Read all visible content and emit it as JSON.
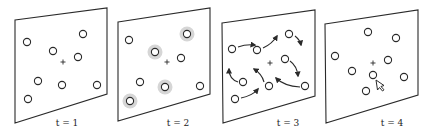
{
  "figure": {
    "panels": [
      {
        "label": "t = 1",
        "frame": [
          [
            15,
            20
          ],
          [
            107,
            8
          ],
          [
            107,
            94
          ],
          [
            15,
            123
          ]
        ],
        "center": [
          63,
          62
        ],
        "label_pos": [
          67,
          126
        ],
        "particles": [
          [
            27,
            42
          ],
          [
            83,
            34
          ],
          [
            53,
            51
          ],
          [
            78,
            57
          ],
          [
            38,
            81
          ],
          [
            62,
            85
          ],
          [
            97,
            85
          ],
          [
            28,
            99
          ]
        ],
        "highlighted": [],
        "arrows": [],
        "cursor": null
      },
      {
        "label": "t = 2",
        "frame": [
          [
            118,
            22
          ],
          [
            210,
            8
          ],
          [
            210,
            94
          ],
          [
            118,
            121
          ]
        ],
        "center": [
          167,
          62
        ],
        "label_pos": [
          178,
          126
        ],
        "particles": [
          [
            129,
            40
          ],
          [
            187,
            34
          ],
          [
            155,
            52
          ],
          [
            181,
            58
          ],
          [
            140,
            82
          ],
          [
            165,
            87
          ],
          [
            200,
            86
          ],
          [
            130,
            101
          ]
        ],
        "highlighted": [
          [
            187,
            34
          ],
          [
            155,
            52
          ],
          [
            165,
            87
          ],
          [
            130,
            101
          ]
        ],
        "arrows": [],
        "cursor": null
      },
      {
        "label": "t = 3",
        "frame": [
          [
            222,
            23
          ],
          [
            315,
            10
          ],
          [
            315,
            96
          ],
          [
            223,
            123
          ]
        ],
        "center": [
          270,
          63
        ],
        "label_pos": [
          288,
          126
        ],
        "particles": [
          [
            232,
            49
          ],
          [
            257,
            50
          ],
          [
            289,
            34
          ],
          [
            285,
            59
          ],
          [
            243,
            82
          ],
          [
            269,
            86
          ],
          [
            305,
            86
          ],
          [
            235,
            99
          ]
        ],
        "highlighted": [],
        "arrows": [
          "M238,47 Q246,44 255,45",
          "M263,48 Q272,44 277,36",
          "M295,36 Q300,40 301,45",
          "M290,61 Q297,66 298,76",
          "M238,82 Q229,79 229,69",
          "M264,82 Q262,74 254,69",
          "M300,87 Q284,86 276,78",
          "M241,98 Q252,96 258,89"
        ],
        "cursor": null
      },
      {
        "label": "t = 4",
        "frame": [
          [
            325,
            24
          ],
          [
            418,
            10
          ],
          [
            418,
            95
          ],
          [
            326,
            123
          ]
        ],
        "center": [
          373,
          63
        ],
        "label_pos": [
          392,
          126
        ],
        "particles": [
          [
            368,
            32
          ],
          [
            396,
            38
          ],
          [
            335,
            56
          ],
          [
            388,
            60
          ],
          [
            352,
            71
          ],
          [
            373,
            75
          ],
          [
            404,
            77
          ],
          [
            366,
            91
          ]
        ],
        "highlighted": [],
        "arrows": [],
        "cursor": {
          "x": 376,
          "y": 80,
          "icon": "mouse-pointer-icon"
        }
      }
    ]
  }
}
